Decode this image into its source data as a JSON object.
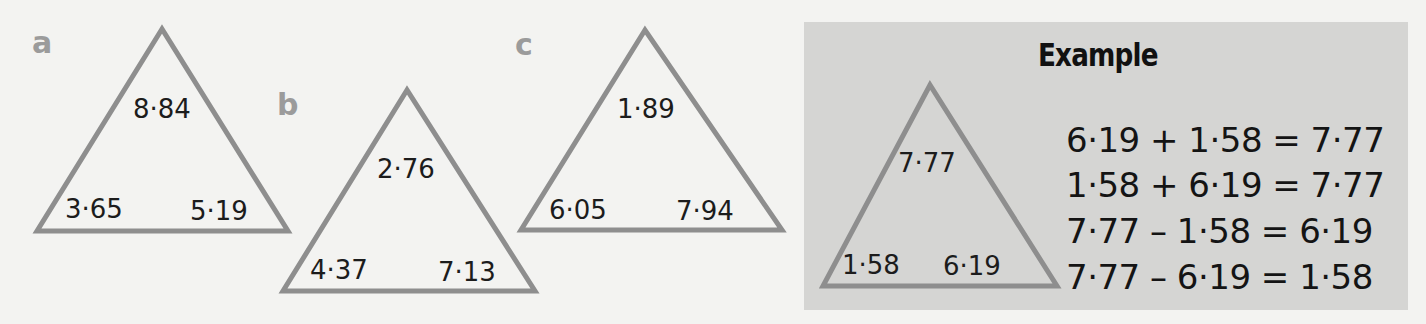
{
  "colors": {
    "page_background": "#f3f3f1",
    "example_box": "#d5d5d3",
    "triangle_stroke": "#8e8e8e",
    "question_label": "#9b9b9b",
    "text": "#1c1c1c"
  },
  "problems": [
    {
      "label": "a",
      "top": "8·84",
      "bottom_left": "3·65",
      "bottom_right": "5·19"
    },
    {
      "label": "b",
      "top": "2·76",
      "bottom_left": "4·37",
      "bottom_right": "7·13"
    },
    {
      "label": "c",
      "top": "1·89",
      "bottom_left": "6·05",
      "bottom_right": "7·94"
    }
  ],
  "example": {
    "title": "Example",
    "triangle": {
      "top": "7·77",
      "bottom_left": "1·58",
      "bottom_right": "6·19"
    },
    "equations": [
      "6·19 + 1·58 = 7·77",
      "1·58 + 6·19 = 7·77",
      "7·77 – 1·58 = 6·19",
      "7·77 – 6·19 = 1·58"
    ]
  }
}
